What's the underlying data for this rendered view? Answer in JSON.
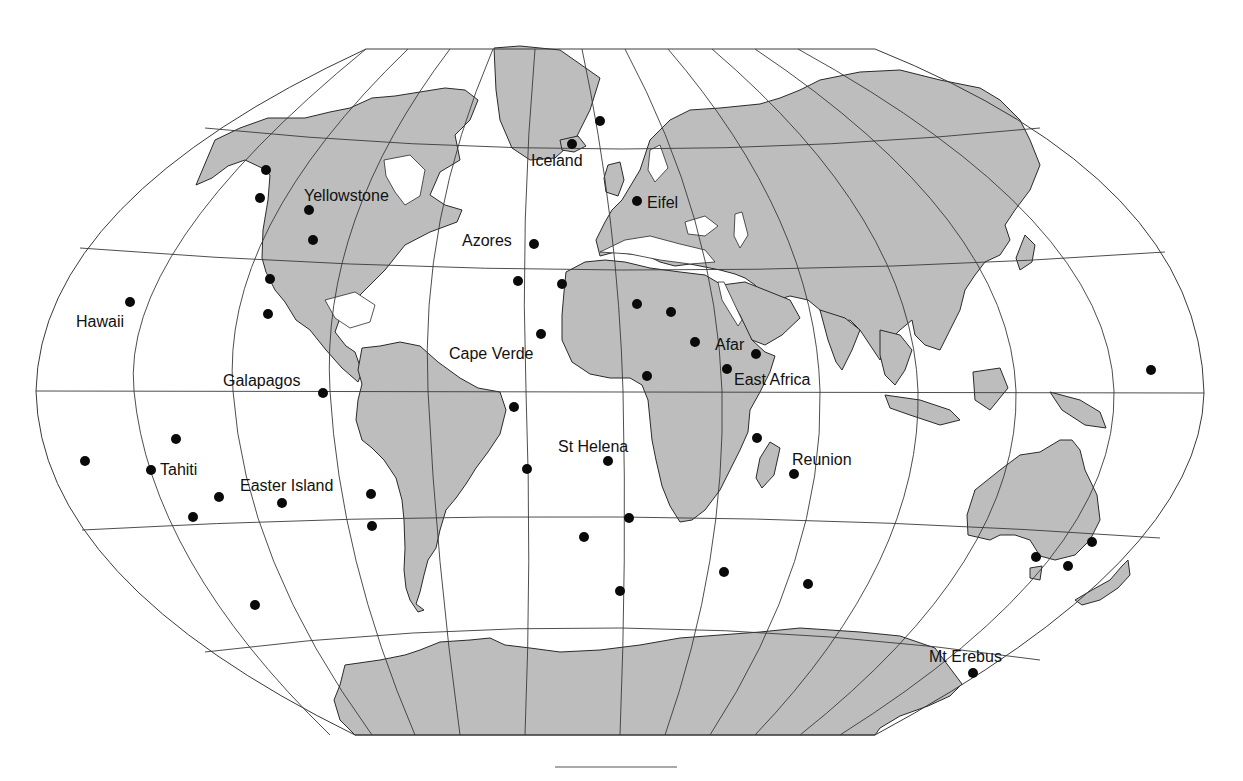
{
  "map": {
    "title": "Global hotspots",
    "projection": "Winkel-style pseudocylindrical world map",
    "colors": {
      "land": "#bdbdbd",
      "ocean": "#ffffff",
      "coast": "#2a2a2a",
      "grid": "#3a3a3a",
      "dot": "#0a0a0a",
      "label": "#111111"
    },
    "labels": [
      {
        "id": "iceland",
        "text": "Iceland",
        "x": 531,
        "y": 166
      },
      {
        "id": "yellowstone",
        "text": "Yellowstone",
        "x": 304,
        "y": 201
      },
      {
        "id": "eifel",
        "text": "Eifel",
        "x": 647,
        "y": 208
      },
      {
        "id": "azores",
        "text": "Azores",
        "x": 462,
        "y": 246
      },
      {
        "id": "hawaii",
        "text": "Hawaii",
        "x": 76,
        "y": 327
      },
      {
        "id": "cape-verde",
        "text": "Cape Verde",
        "x": 449,
        "y": 359
      },
      {
        "id": "afar",
        "text": "Afar",
        "x": 715,
        "y": 350
      },
      {
        "id": "east-africa",
        "text": "East Africa",
        "x": 734,
        "y": 385
      },
      {
        "id": "galapagos",
        "text": "Galapagos",
        "x": 223,
        "y": 386
      },
      {
        "id": "st-helena",
        "text": "St Helena",
        "x": 558,
        "y": 452
      },
      {
        "id": "reunion",
        "text": "Reunion",
        "x": 792,
        "y": 465
      },
      {
        "id": "tahiti",
        "text": "Tahiti",
        "x": 160,
        "y": 475
      },
      {
        "id": "easter-island",
        "text": "Easter Island",
        "x": 240,
        "y": 491
      },
      {
        "id": "mt-erebus",
        "text": "Mt Erebus",
        "x": 929,
        "y": 662
      }
    ],
    "hotspots": [
      {
        "name": "Jan Mayen",
        "x": 600,
        "y": 121
      },
      {
        "name": "Iceland",
        "x": 572,
        "y": 144
      },
      {
        "name": "Bowie",
        "x": 266,
        "y": 170
      },
      {
        "name": "Cobb",
        "x": 260,
        "y": 198
      },
      {
        "name": "Yellowstone",
        "x": 309,
        "y": 210
      },
      {
        "name": "Raton",
        "x": 313,
        "y": 240
      },
      {
        "name": "Eifel",
        "x": 637,
        "y": 201
      },
      {
        "name": "Azores",
        "x": 534,
        "y": 244
      },
      {
        "name": "Great Meteor",
        "x": 518,
        "y": 281
      },
      {
        "name": "Canary",
        "x": 562,
        "y": 284
      },
      {
        "name": "Guadalupe",
        "x": 270,
        "y": 279
      },
      {
        "name": "Socorro",
        "x": 268,
        "y": 314
      },
      {
        "name": "Hawaii",
        "x": 130,
        "y": 302
      },
      {
        "name": "Hoggar",
        "x": 637,
        "y": 304
      },
      {
        "name": "Tibesti",
        "x": 671,
        "y": 312
      },
      {
        "name": "Cape Verde",
        "x": 541,
        "y": 334
      },
      {
        "name": "Darfur",
        "x": 695,
        "y": 342
      },
      {
        "name": "Afar",
        "x": 756,
        "y": 354
      },
      {
        "name": "East Africa",
        "x": 727,
        "y": 369
      },
      {
        "name": "Cameroon",
        "x": 647,
        "y": 376
      },
      {
        "name": "Caroline",
        "x": 1151,
        "y": 370
      },
      {
        "name": "Galapagos",
        "x": 323,
        "y": 393
      },
      {
        "name": "Fernando",
        "x": 514,
        "y": 407
      },
      {
        "name": "Samoa",
        "x": 176,
        "y": 439
      },
      {
        "name": "Comoros",
        "x": 757,
        "y": 438
      },
      {
        "name": "Cook-Austral West",
        "x": 85,
        "y": 461
      },
      {
        "name": "Tahiti",
        "x": 151,
        "y": 470
      },
      {
        "name": "St Helena",
        "x": 608,
        "y": 461
      },
      {
        "name": "Trindade",
        "x": 527,
        "y": 469
      },
      {
        "name": "Reunion",
        "x": 794,
        "y": 474
      },
      {
        "name": "Pitcairn",
        "x": 219,
        "y": 497
      },
      {
        "name": "Easter Island",
        "x": 282,
        "y": 503
      },
      {
        "name": "Juan Fernandez",
        "x": 371,
        "y": 494
      },
      {
        "name": "Macdonald",
        "x": 193,
        "y": 517
      },
      {
        "name": "San Felix",
        "x": 372,
        "y": 526
      },
      {
        "name": "Tristan",
        "x": 629,
        "y": 518
      },
      {
        "name": "Gough",
        "x": 584,
        "y": 537
      },
      {
        "name": "Lord Howe",
        "x": 1092,
        "y": 542
      },
      {
        "name": "East Australia",
        "x": 1036,
        "y": 557
      },
      {
        "name": "Tasman",
        "x": 1068,
        "y": 566
      },
      {
        "name": "Marion",
        "x": 724,
        "y": 572
      },
      {
        "name": "Crozet",
        "x": 808,
        "y": 584
      },
      {
        "name": "Bouvet",
        "x": 620,
        "y": 591
      },
      {
        "name": "Louisville",
        "x": 255,
        "y": 605
      },
      {
        "name": "Mt Erebus",
        "x": 973,
        "y": 673
      }
    ],
    "scale_bar": {
      "x1": 555,
      "x2": 677,
      "y": 767
    }
  }
}
